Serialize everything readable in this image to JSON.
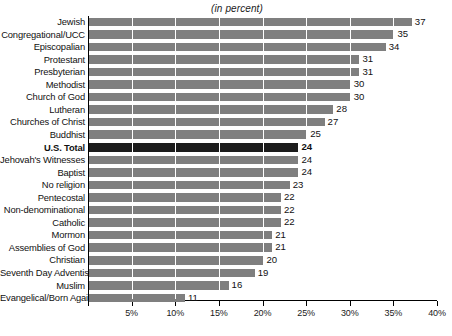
{
  "chart_data": {
    "type": "bar",
    "orientation": "horizontal",
    "title": "(in percent)",
    "xlabel": "",
    "ylabel": "",
    "xlim": [
      0,
      40
    ],
    "xticks": [
      0,
      5,
      10,
      15,
      20,
      25,
      30,
      35,
      40
    ],
    "xtick_labels": [
      "",
      "5%",
      "10%",
      "15%",
      "20%",
      "25%",
      "30%",
      "35%",
      "40%"
    ],
    "grid": true,
    "legend": null,
    "categories": [
      "Jewish",
      "Congregational/UCC",
      "Episcopalian",
      "Protestant",
      "Presbyterian",
      "Methodist",
      "Church of God",
      "Lutheran",
      "Churches of Christ",
      "Buddhist",
      "U.S. Total",
      "Jehovah's Witnesses",
      "Baptist",
      "No religion",
      "Pentecostal",
      "Non-denominational",
      "Catholic",
      "Mormon",
      "Assemblies of God",
      "Christian",
      "Seventh Day Adventist",
      "Muslim",
      "Evangelical/Born Again"
    ],
    "values": [
      37,
      35,
      34,
      31,
      31,
      30,
      30,
      28,
      27,
      25,
      24,
      24,
      24,
      23,
      22,
      22,
      22,
      21,
      21,
      20,
      19,
      16,
      11
    ],
    "highlight_category": "U.S. Total",
    "bar_color": "#7f7f7f",
    "highlight_color": "#1c1c1c",
    "gridline_color": "#ffffff",
    "axis_color": "#000000",
    "background": "#ffffff"
  }
}
